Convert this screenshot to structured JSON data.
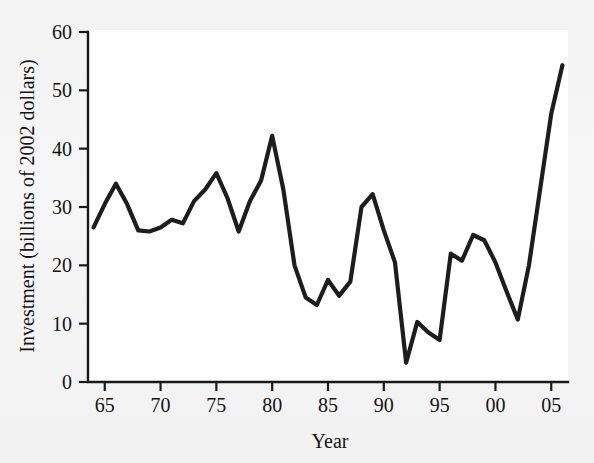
{
  "chart_data": {
    "type": "line",
    "title": "",
    "subtitle": "",
    "xlabel": "Year",
    "ylabel": "Investment (billions of 2002 dollars)",
    "xlim": [
      1963.5,
      2006.5
    ],
    "ylim": [
      0,
      60
    ],
    "grid": false,
    "legend": null,
    "legend_position": "none",
    "line_color": "#1d1d1d",
    "background_color": "#ffffff",
    "page_color": "#f3f3f3",
    "y_ticks": [
      0,
      10,
      20,
      30,
      40,
      50,
      60
    ],
    "y_tick_labels": [
      "0",
      "10",
      "20",
      "30",
      "40",
      "50",
      "60"
    ],
    "x_ticks": [
      1965,
      1970,
      1975,
      1980,
      1985,
      1990,
      1995,
      2000,
      2005
    ],
    "x_tick_labels": [
      "65",
      "70",
      "75",
      "80",
      "85",
      "90",
      "95",
      "00",
      "05"
    ],
    "x": [
      1964,
      1965,
      1966,
      1967,
      1968,
      1969,
      1970,
      1971,
      1972,
      1973,
      1974,
      1975,
      1976,
      1977,
      1978,
      1979,
      1980,
      1981,
      1982,
      1983,
      1984,
      1985,
      1986,
      1987,
      1988,
      1989,
      1990,
      1991,
      1992,
      1993,
      1994,
      1995,
      1996,
      1997,
      1998,
      1999,
      2000,
      2001,
      2002,
      2003,
      2004,
      2005,
      2006
    ],
    "values": [
      26.5,
      30.5,
      34.0,
      30.5,
      26.0,
      25.8,
      26.5,
      27.8,
      27.2,
      31.0,
      33.0,
      35.8,
      31.5,
      25.8,
      31.0,
      34.5,
      42.2,
      33.0,
      20.0,
      14.5,
      13.2,
      17.5,
      14.8,
      17.2,
      30.0,
      32.2,
      26.0,
      20.5,
      3.3,
      10.3,
      8.5,
      7.2,
      22.0,
      20.8,
      25.2,
      24.3,
      20.5,
      15.5,
      10.7,
      20.0,
      33.0,
      46.0,
      54.3
    ],
    "series": [
      {
        "name": "Investment",
        "values": [
          26.5,
          30.5,
          34.0,
          30.5,
          26.0,
          25.8,
          26.5,
          27.8,
          27.2,
          31.0,
          33.0,
          35.8,
          31.5,
          25.8,
          31.0,
          34.5,
          42.2,
          33.0,
          20.0,
          14.5,
          13.2,
          17.5,
          14.8,
          17.2,
          30.0,
          32.2,
          26.0,
          20.5,
          3.3,
          10.3,
          8.5,
          7.2,
          22.0,
          20.8,
          25.2,
          24.3,
          20.5,
          15.5,
          10.7,
          20.0,
          33.0,
          46.0,
          54.3
        ]
      }
    ],
    "annotations": []
  }
}
